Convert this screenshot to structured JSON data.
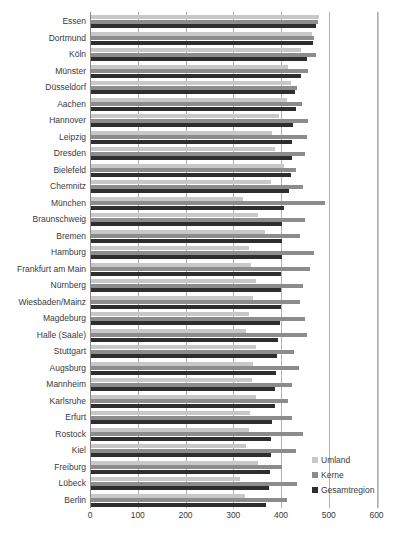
{
  "chart_data": {
    "type": "bar",
    "orientation": "horizontal",
    "title": "",
    "xlabel": "",
    "ylabel": "",
    "xlim": [
      0,
      600
    ],
    "x_ticks": [
      "0",
      "100",
      "200",
      "300",
      "400",
      "500",
      "600"
    ],
    "grid": true,
    "legend_position": "bottom-right",
    "categories": [
      "Essen",
      "Dortmund",
      "Köln",
      "Münster",
      "Düsseldorf",
      "Aachen",
      "Hannover",
      "Leipzig",
      "Dresden",
      "Bielefeld",
      "Chemnitz",
      "München",
      "Braunschweig",
      "Bremen",
      "Hamburg",
      "Frankfurt am Main",
      "Nürnberg",
      "Wiesbaden/Mainz",
      "Magdeburg",
      "Halle (Saale)",
      "Stuttgart",
      "Augsburg",
      "Mannheim",
      "Karlsruhe",
      "Erfurt",
      "Rostock",
      "Kiel",
      "Freiburg",
      "Lübeck",
      "Berlin"
    ],
    "series": [
      {
        "name": "Umland",
        "color": "#c8c8c8",
        "values": [
          478,
          462,
          440,
          412,
          418,
          410,
          393,
          380,
          385,
          405,
          378,
          318,
          350,
          365,
          330,
          335,
          345,
          340,
          330,
          325,
          345,
          340,
          338,
          345,
          332,
          330,
          325,
          350,
          312,
          322
        ]
      },
      {
        "name": "Kerne",
        "color": "#8c8c8c",
        "values": [
          475,
          468,
          472,
          455,
          432,
          442,
          455,
          452,
          448,
          430,
          445,
          490,
          448,
          438,
          468,
          458,
          445,
          438,
          448,
          452,
          425,
          435,
          420,
          412,
          420,
          445,
          430,
          400,
          432,
          410
        ]
      },
      {
        "name": "Gesamtregion",
        "color": "#2e2e2e",
        "values": [
          472,
          465,
          452,
          440,
          428,
          430,
          422,
          420,
          420,
          418,
          415,
          405,
          400,
          400,
          400,
          398,
          398,
          398,
          395,
          392,
          390,
          388,
          385,
          385,
          380,
          378,
          377,
          375,
          372,
          367
        ]
      }
    ]
  },
  "legend": {
    "items": [
      {
        "label": "Umland",
        "color": "#c8c8c8"
      },
      {
        "label": "Kerne",
        "color": "#8c8c8c"
      },
      {
        "label": "Gesamtregion",
        "color": "#2e2e2e"
      }
    ]
  }
}
